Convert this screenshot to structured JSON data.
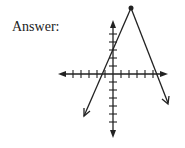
{
  "label": "Answer:",
  "graph": {
    "x_ticks": [
      -4,
      -3,
      -2,
      -1,
      1,
      2,
      3,
      4,
      5,
      6
    ],
    "y_ticks": [
      -1,
      -2,
      -3,
      -4,
      -5,
      -6,
      -7,
      1,
      2,
      3,
      4,
      5,
      6
    ],
    "vertex_point": "filled-dot",
    "lines": [
      "left line through vertex with downward-left arrow",
      "right line from vertex with downward-right arrow"
    ],
    "colors": {
      "ink": "#222222",
      "background": "#ffffff"
    }
  }
}
